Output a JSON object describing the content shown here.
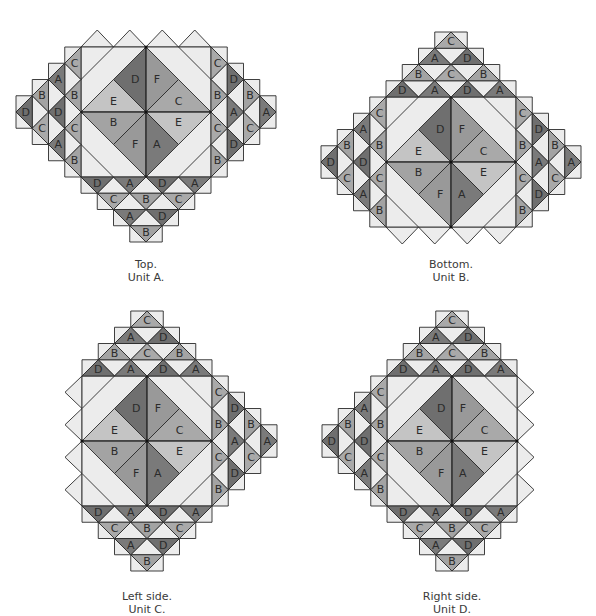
{
  "colors": {
    "A": "#7a7a7a",
    "B": "#a3a3a3",
    "C": "#a9a9a9",
    "D": "#6f6f6f",
    "E": "#c4c4c4",
    "F": "#999999",
    "light": "#ececec",
    "stroke": "#2a2a2a"
  },
  "units": [
    {
      "id": "top",
      "caption_line1": "Top.",
      "caption_line2": "Unit A.",
      "center": [
        146,
        112
      ],
      "caption_pos": [
        66,
        258
      ],
      "center_labels": [
        "D",
        "F",
        "E",
        "C",
        "B",
        "E",
        "F",
        "A"
      ],
      "strips": {
        "bottom": [
          [
            "D",
            "A",
            "D",
            "A"
          ],
          [
            "C",
            "B",
            "C"
          ],
          [
            "A",
            "D"
          ],
          [
            "B"
          ]
        ],
        "left": [
          [
            "C",
            "B",
            "C",
            "B"
          ],
          [
            "A",
            "D",
            "A"
          ],
          [
            "B",
            "C"
          ],
          [
            "D"
          ]
        ],
        "right": [
          [
            "C",
            "B",
            "C",
            "B"
          ],
          [
            "D",
            "A",
            "D"
          ],
          [
            "B",
            "C"
          ],
          [
            "A"
          ]
        ]
      },
      "extension": "top"
    },
    {
      "id": "bottom",
      "caption_line1": "Bottom.",
      "caption_line2": "Unit B.",
      "center": [
        451,
        162
      ],
      "caption_pos": [
        371,
        258
      ],
      "center_labels": [
        "D",
        "F",
        "E",
        "C",
        "B",
        "E",
        "F",
        "A"
      ],
      "strips": {
        "top": [
          [
            "D",
            "A",
            "D",
            "A"
          ],
          [
            "B",
            "C",
            "B"
          ],
          [
            "A",
            "D"
          ],
          [
            "C"
          ]
        ],
        "left": [
          [
            "C",
            "B",
            "C",
            "B"
          ],
          [
            "A",
            "D",
            "A"
          ],
          [
            "B",
            "C"
          ],
          [
            "D"
          ]
        ],
        "right": [
          [
            "C",
            "B",
            "C",
            "B"
          ],
          [
            "D",
            "A",
            "D"
          ],
          [
            "B",
            "C"
          ],
          [
            "A"
          ]
        ]
      },
      "extension": "bottom"
    },
    {
      "id": "left",
      "caption_line1": "Left side.",
      "caption_line2": "Unit C.",
      "center": [
        147,
        441
      ],
      "caption_pos": [
        67,
        590
      ],
      "center_labels": [
        "D",
        "F",
        "E",
        "C",
        "B",
        "E",
        "F",
        "A"
      ],
      "strips": {
        "top": [
          [
            "D",
            "A",
            "D",
            "A"
          ],
          [
            "B",
            "C",
            "B"
          ],
          [
            "A",
            "D"
          ],
          [
            "C"
          ]
        ],
        "bottom": [
          [
            "D",
            "A",
            "D",
            "A"
          ],
          [
            "C",
            "B",
            "C"
          ],
          [
            "A",
            "D"
          ],
          [
            "B"
          ]
        ],
        "right": [
          [
            "C",
            "B",
            "C",
            "B"
          ],
          [
            "D",
            "A",
            "D"
          ],
          [
            "B",
            "C"
          ],
          [
            "A"
          ]
        ]
      },
      "extension": "left"
    },
    {
      "id": "right",
      "caption_line1": "Right side.",
      "caption_line2": "Unit D.",
      "center": [
        452,
        441
      ],
      "caption_pos": [
        372,
        590
      ],
      "center_labels": [
        "D",
        "F",
        "E",
        "C",
        "B",
        "E",
        "F",
        "A"
      ],
      "strips": {
        "top": [
          [
            "D",
            "A",
            "D",
            "A"
          ],
          [
            "B",
            "C",
            "B"
          ],
          [
            "A",
            "D"
          ],
          [
            "C"
          ]
        ],
        "bottom": [
          [
            "D",
            "A",
            "D",
            "A"
          ],
          [
            "C",
            "B",
            "C"
          ],
          [
            "A",
            "D"
          ],
          [
            "B"
          ]
        ],
        "left": [
          [
            "C",
            "B",
            "C",
            "B"
          ],
          [
            "A",
            "D",
            "A"
          ],
          [
            "B",
            "C"
          ],
          [
            "D"
          ]
        ]
      },
      "extension": "right"
    }
  ]
}
